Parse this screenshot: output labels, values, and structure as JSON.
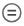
{
  "icon": {
    "name": "circled-equals-icon",
    "ring_color": "#5f5f5f",
    "bar_color": "#3f3f3f",
    "background": "#ffffff"
  }
}
